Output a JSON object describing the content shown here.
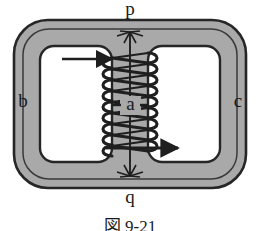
{
  "figure": {
    "caption": "図 9-21"
  },
  "labels": {
    "top": "p",
    "bottom": "q",
    "left": "b",
    "right": "c",
    "center": "a"
  },
  "colors": {
    "core_fill": "#a9a9a9",
    "window_fill": "#ffffff",
    "stroke": "#262626",
    "coil": "#1f1f1f",
    "background": "#ffffff",
    "text": "#1a1a1a"
  },
  "geometry": {
    "core_outer": {
      "x": 14,
      "y": 20,
      "width": 232,
      "height": 168,
      "rx": 34
    },
    "core_inner_outline": {
      "x": 22,
      "y": 28,
      "width": 216,
      "height": 152,
      "rx": 28
    },
    "window_left": {
      "x": 40,
      "y": 46,
      "width": 72,
      "height": 116,
      "rx": 14
    },
    "window_right": {
      "x": 148,
      "y": 46,
      "width": 72,
      "height": 116,
      "rx": 14
    },
    "center_column": {
      "x": 112,
      "y": 28,
      "width": 36,
      "height": 152
    },
    "coil_turns": 9,
    "coil_top": 58,
    "coil_bottom": 152,
    "dimension_line": {
      "x": 130,
      "y_top": 30,
      "y_bottom": 178
    }
  },
  "annotations": {
    "lead_arrow_left": "current-lead-in-arrow",
    "lead_arrow_right": "current-lead-out-arrow",
    "dimension_arrow": "p-to-q-dimension-arrow"
  }
}
